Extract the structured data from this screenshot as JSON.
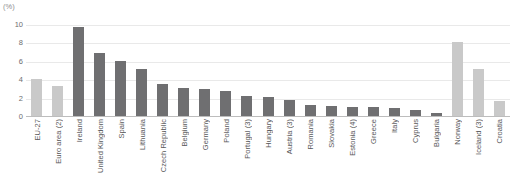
{
  "chart_data": {
    "type": "bar",
    "title": "",
    "subtitle": "",
    "xlabel": "",
    "ylabel": "(%)",
    "ylim": [
      0,
      10
    ],
    "yticks": [
      0,
      2,
      4,
      6,
      8,
      10
    ],
    "grid": true,
    "legend": "none",
    "categories": [
      "EU-27",
      "Euro area (2)",
      "Ireland",
      "United Kingdom",
      "Spain",
      "Lithuania",
      "Czech Republic",
      "Belgium",
      "Germany",
      "Poland",
      "Portugal (3)",
      "Hungary",
      "Austria (3)",
      "Romania",
      "Slovakia",
      "Estonia (4)",
      "Greece",
      "Italy",
      "Cyprus",
      "Bulgaria",
      "Norway",
      "Iceland (3)",
      "Croatia"
    ],
    "values": [
      4.1,
      3.4,
      9.8,
      7.0,
      6.1,
      5.2,
      3.6,
      3.1,
      3.0,
      2.8,
      2.3,
      2.2,
      1.8,
      1.3,
      1.2,
      1.1,
      1.1,
      1.0,
      0.8,
      0.4,
      8.2,
      5.2,
      1.7
    ],
    "bar_styles": [
      "light",
      "light",
      "dark",
      "dark",
      "dark",
      "dark",
      "dark",
      "dark",
      "dark",
      "dark",
      "dark",
      "dark",
      "dark",
      "dark",
      "dark",
      "dark",
      "dark",
      "dark",
      "dark",
      "dark",
      "light",
      "light",
      "light"
    ],
    "colors": {
      "dark_bar": "#6f6f71",
      "light_bar": "#c9c9c9",
      "gridline": "#e9e9e9",
      "axis": "#bdbdbd",
      "text": "#58585a"
    }
  }
}
